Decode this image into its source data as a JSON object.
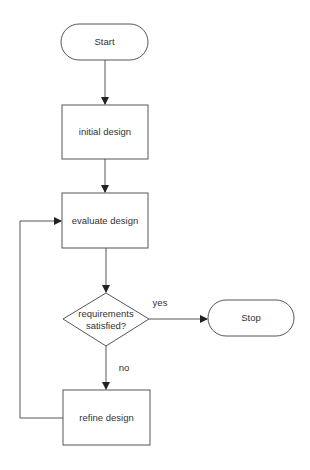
{
  "nodes": {
    "start": {
      "label": "Start"
    },
    "initial": {
      "label": "initial design"
    },
    "evaluate": {
      "label": "evaluate design"
    },
    "decision": {
      "line1": "requirements",
      "line2": "satisfied?"
    },
    "stop": {
      "label": "Stop"
    },
    "refine": {
      "label": "refine design"
    }
  },
  "edges": {
    "yes": "yes",
    "no": "no"
  }
}
